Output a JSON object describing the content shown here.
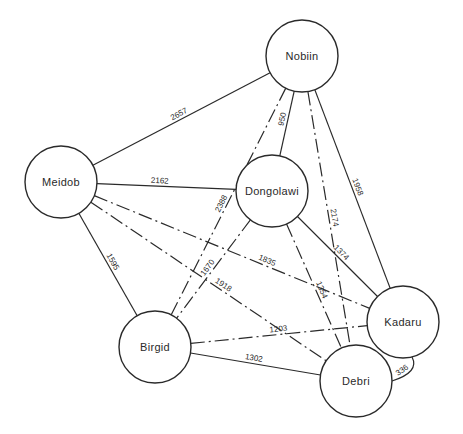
{
  "diagram": {
    "type": "network",
    "nodes": [
      {
        "id": "nobiin",
        "label": "Nobiin",
        "x": 302,
        "y": 56,
        "r": 36
      },
      {
        "id": "meidob",
        "label": "Meidob",
        "x": 61,
        "y": 182,
        "r": 36
      },
      {
        "id": "dongolawi",
        "label": "Dongolawi",
        "x": 272,
        "y": 191,
        "r": 36
      },
      {
        "id": "birgid",
        "label": "Birgid",
        "x": 155,
        "y": 347,
        "r": 36
      },
      {
        "id": "kadaru",
        "label": "Kadaru",
        "x": 403,
        "y": 322,
        "r": 36
      },
      {
        "id": "debri",
        "label": "Debri",
        "x": 356,
        "y": 381,
        "r": 36
      }
    ],
    "edges": [
      {
        "from": "nobiin",
        "to": "meidob",
        "label": "2657",
        "style": "solid"
      },
      {
        "from": "meidob",
        "to": "dongolawi",
        "label": "2162",
        "style": "solid"
      },
      {
        "from": "nobiin",
        "to": "dongolawi",
        "label": "950",
        "style": "solid"
      },
      {
        "from": "nobiin",
        "to": "birgid",
        "label": "2388",
        "style": "dashed"
      },
      {
        "from": "nobiin",
        "to": "debri",
        "label": "2174",
        "style": "dashed"
      },
      {
        "from": "nobiin",
        "to": "kadaru",
        "label": "1958",
        "style": "solid"
      },
      {
        "from": "meidob",
        "to": "birgid",
        "label": "1595",
        "style": "solid"
      },
      {
        "from": "meidob",
        "to": "kadaru",
        "label": "1835",
        "style": "dashed"
      },
      {
        "from": "meidob",
        "to": "debri",
        "label": "1918",
        "style": "dashed"
      },
      {
        "from": "dongolawi",
        "to": "birgid",
        "label": "1670",
        "style": "dashed"
      },
      {
        "from": "dongolawi",
        "to": "kadaru",
        "label": "1374",
        "style": "solid"
      },
      {
        "from": "dongolawi",
        "to": "debri",
        "label": "1354",
        "style": "dashed"
      },
      {
        "from": "birgid",
        "to": "kadaru",
        "label": "1203",
        "style": "dashed"
      },
      {
        "from": "birgid",
        "to": "debri",
        "label": "1302",
        "style": "solid"
      },
      {
        "from": "kadaru",
        "to": "debri",
        "label": "336",
        "style": "arc"
      }
    ]
  }
}
